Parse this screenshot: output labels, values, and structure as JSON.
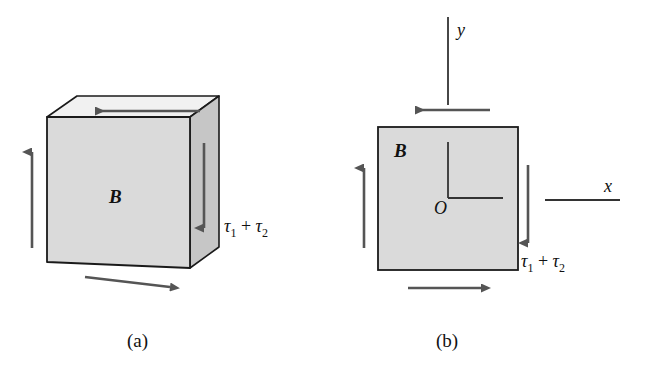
{
  "figure": {
    "type": "mechanics-diagram",
    "background_color": "#ffffff",
    "face_fill": "#d9d9d9",
    "top_face_fill": "#f0f0f0",
    "side_face_fill": "#c9c9c9",
    "outline_color": "#1a1a1a",
    "arrow_color": "#555555",
    "text_color": "#111111"
  },
  "panels": [
    {
      "id": "a",
      "caption": "(a)",
      "body_label": "B",
      "stress_label": {
        "tau": "τ",
        "sub1": "1",
        "plus": "+",
        "sub2": "2",
        "full": "τ1 + τ2"
      },
      "arrows": [
        {
          "name": "left-face-shear-up",
          "direction": "up"
        },
        {
          "name": "top-face-shear-left",
          "direction": "left"
        },
        {
          "name": "right-face-shear-down",
          "direction": "down"
        },
        {
          "name": "bottom-face-shear-right",
          "direction": "right"
        }
      ]
    },
    {
      "id": "b",
      "caption": "(b)",
      "body_label": "B",
      "origin_label": "O",
      "axis_x_label": "x",
      "axis_y_label": "y",
      "stress_label": {
        "tau": "τ",
        "sub1": "1",
        "plus": "+",
        "sub2": "2",
        "full": "τ1 + τ2"
      },
      "arrows": [
        {
          "name": "left-edge-shear-up",
          "direction": "up"
        },
        {
          "name": "top-edge-shear-left",
          "direction": "left"
        },
        {
          "name": "right-edge-shear-down",
          "direction": "down"
        },
        {
          "name": "bottom-edge-shear-right",
          "direction": "right"
        }
      ]
    }
  ]
}
